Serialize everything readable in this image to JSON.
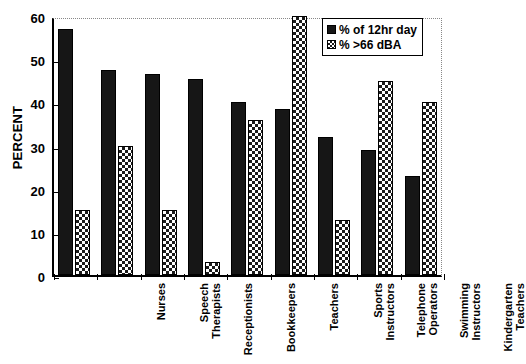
{
  "chart_data": {
    "type": "bar",
    "title": "",
    "xlabel": "",
    "ylabel": "PERCENT",
    "ylim": [
      0,
      60
    ],
    "yticks": [
      0,
      10,
      20,
      30,
      40,
      50,
      60
    ],
    "grid": false,
    "legend_position": "top-right",
    "categories": [
      "Nurses",
      "Speech\nTherapists",
      "Receptionists",
      "Bookkeepers",
      "Teachers",
      "Sports\nInstructors",
      "Telephone\nOperators",
      "Swimming\nInstructors",
      "Kindergarten\nTeachers"
    ],
    "series": [
      {
        "name": "% of 12hr day",
        "pattern": "solid",
        "values": [
          57,
          47.5,
          46.5,
          45.5,
          40,
          38.5,
          32,
          29,
          23
        ]
      },
      {
        "name": "% >66 dBA",
        "pattern": "checker",
        "values": [
          15,
          30,
          15,
          3,
          36,
          60,
          12.8,
          45,
          40
        ]
      }
    ]
  },
  "colors": {
    "solid_fill": "#161616",
    "checker_fill": "#1a1a1a",
    "checker_bg": "#ffffff",
    "axis": "#000000",
    "frame_dotted": "#888888",
    "background": "#ffffff"
  }
}
